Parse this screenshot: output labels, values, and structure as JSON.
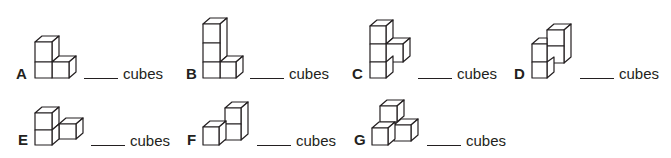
{
  "worksheet": {
    "unit_label": "cubes",
    "items": [
      {
        "letter": "A",
        "answer": "",
        "cubes_pictured": "L-shape: 2 stacked + 1 right"
      },
      {
        "letter": "B",
        "answer": "",
        "cubes_pictured": "3 stacked + 1 right"
      },
      {
        "letter": "C",
        "answer": "",
        "cubes_pictured": "3 stacked + 1 right middle"
      },
      {
        "letter": "D",
        "answer": "",
        "cubes_pictured": "2 stacked left, 2 stacked right raised"
      },
      {
        "letter": "E",
        "answer": "",
        "cubes_pictured": "2 stacked + 1 right"
      },
      {
        "letter": "F",
        "answer": "",
        "cubes_pictured": "1 left + 2 stacked right"
      },
      {
        "letter": "G",
        "answer": "",
        "cubes_pictured": "pyramid: 2 bottom + 1 top"
      }
    ]
  }
}
